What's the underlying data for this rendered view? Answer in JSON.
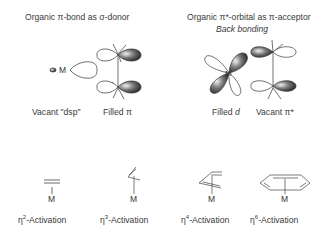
{
  "diagram": {
    "left_panel": {
      "title": "Organic π-bond as σ-donor",
      "metal_label": "M",
      "caption_left": "Vacant \"dsp\"",
      "caption_right": "Filled π"
    },
    "right_panel": {
      "title": "Organic π*-orbital as π-acceptor",
      "subtitle": "Back bonding",
      "metal_label": "M",
      "caption_left_prefix": "Filled ",
      "caption_left_italic": "d",
      "caption_right": "Vacant π*"
    },
    "activations": [
      {
        "eta": "η",
        "hapticity": "2",
        "suffix": "-Activation",
        "metal": "M",
        "ligand": "alkene"
      },
      {
        "eta": "η",
        "hapticity": "3",
        "suffix": "-Activation",
        "metal": "M",
        "ligand": "allyl"
      },
      {
        "eta": "η",
        "hapticity": "4",
        "suffix": "-Activation",
        "metal": "M",
        "ligand": "diene"
      },
      {
        "eta": "η",
        "hapticity": "6",
        "suffix": "-Activation",
        "metal": "M",
        "ligand": "arene"
      }
    ]
  }
}
